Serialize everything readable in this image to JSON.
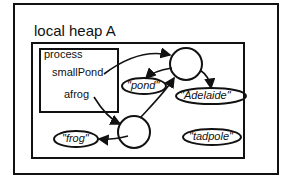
{
  "heap": {
    "title": "local heap A",
    "process": {
      "label": "process",
      "variables": [
        "smallPond",
        "afrog"
      ]
    },
    "strings": {
      "pond": "\"pond\"",
      "adelaide": "\"Adelaide\"",
      "frog": "\"frog\"",
      "tadpole": "\"tadpole\""
    }
  }
}
